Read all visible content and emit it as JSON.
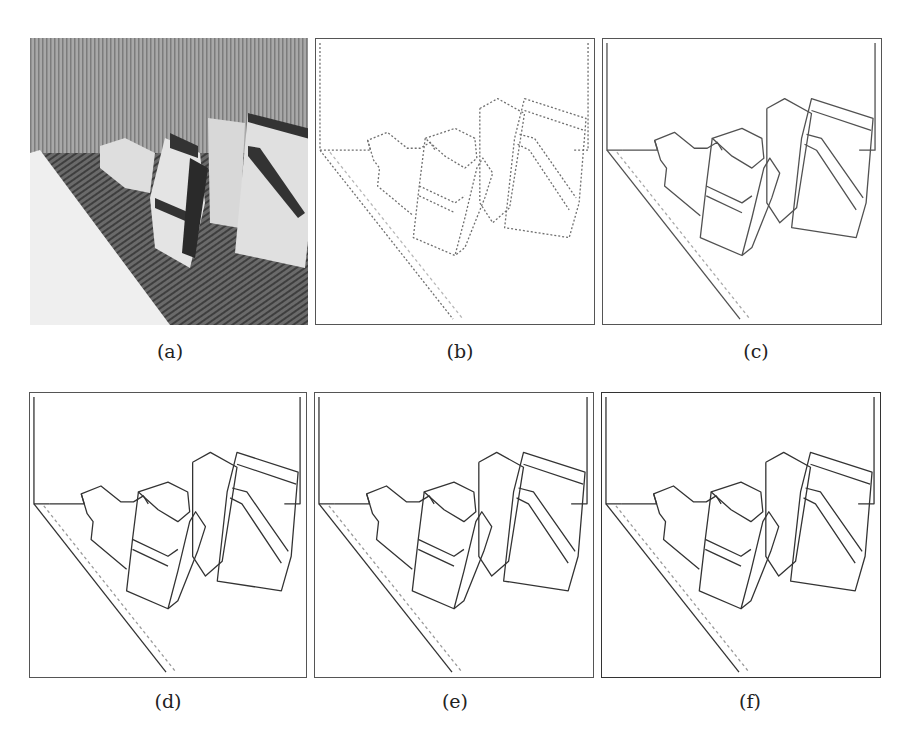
{
  "figure": {
    "panels": [
      {
        "id": "a",
        "label": "(a)",
        "kind": "grayscale-photo"
      },
      {
        "id": "b",
        "label": "(b)",
        "kind": "edge-map"
      },
      {
        "id": "c",
        "label": "(c)",
        "kind": "edge-map"
      },
      {
        "id": "d",
        "label": "(d)",
        "kind": "edge-map"
      },
      {
        "id": "e",
        "label": "(e)",
        "kind": "edge-map"
      },
      {
        "id": "f",
        "label": "(f)",
        "kind": "edge-map"
      }
    ]
  }
}
